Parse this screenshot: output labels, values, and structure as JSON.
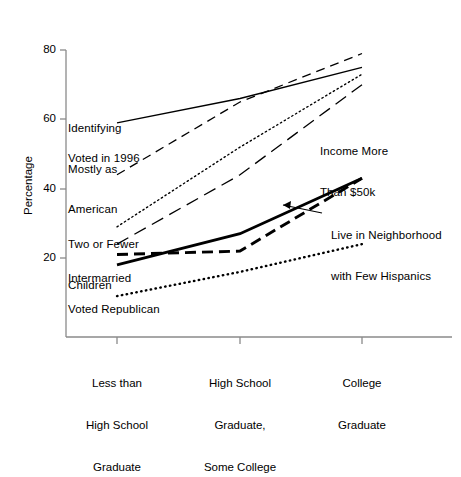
{
  "chart_data": {
    "type": "line",
    "title": "",
    "xlabel": "",
    "ylabel": "Percentage",
    "categories": [
      "Less than\nHigh School\nGraduate",
      "High School\nGraduate,\nSome College",
      "College\nGraduate"
    ],
    "category_labels": [
      [
        "Less than",
        "High School",
        "Graduate"
      ],
      [
        "High School",
        "Graduate,",
        "Some College"
      ],
      [
        "College",
        "Graduate"
      ]
    ],
    "ylim": [
      0,
      88
    ],
    "yticks": [
      20,
      40,
      60,
      80
    ],
    "ytick_labels": [
      "20",
      "40",
      "60",
      "80"
    ],
    "grid": false,
    "legend_position": "inline-annotations",
    "series": [
      {
        "name": "Identifying Mostly as American",
        "style": "solid-thin",
        "values": [
          59,
          66,
          75
        ]
      },
      {
        "name": "Voted in 1996",
        "style": "dashed",
        "values": [
          44,
          65,
          79
        ]
      },
      {
        "name": "Two or Fewer Children",
        "style": "dotted-fine",
        "values": [
          29,
          52,
          73
        ]
      },
      {
        "name": "Income More Than $50k",
        "style": "long-dash",
        "values": [
          24,
          44,
          70
        ]
      },
      {
        "name": "Live in Neighborhood with Few Hispanics",
        "style": "solid-thick",
        "values": [
          18,
          27,
          43
        ]
      },
      {
        "name": "Intermarried",
        "style": "dashed-thick",
        "values": [
          21,
          22,
          43
        ]
      },
      {
        "name": "Voted Republican",
        "style": "dotted-thick",
        "values": [
          9,
          16,
          24
        ]
      }
    ],
    "annotations": [
      {
        "id": "identifying-mostly-as-american",
        "lines": [
          "Identifying",
          "Mostly as",
          "American"
        ]
      },
      {
        "id": "voted-in-1996",
        "lines": [
          "Voted in 1996"
        ]
      },
      {
        "id": "two-or-fewer-children",
        "lines": [
          "Two or Fewer",
          "Children"
        ]
      },
      {
        "id": "intermarried",
        "lines": [
          "Intermarried"
        ]
      },
      {
        "id": "voted-republican",
        "lines": [
          "Voted Republican"
        ]
      },
      {
        "id": "income-more-than-50k",
        "lines": [
          "Income More",
          "Than $50k"
        ]
      },
      {
        "id": "live-in-neighborhood-few-hispanics",
        "lines": [
          "Live in Neighborhood",
          "with Few Hispanics"
        ]
      }
    ],
    "colors": {
      "line": "#000000",
      "axis": "#808080",
      "text": "#000000",
      "background": "#ffffff"
    }
  },
  "axis": {
    "y_label": "Percentage",
    "y_tick_0": "20",
    "y_tick_1": "40",
    "y_tick_2": "60",
    "y_tick_3": "80"
  },
  "annotations": {
    "a0_l0": "Identifying",
    "a0_l1": "Mostly as",
    "a0_l2": "American",
    "a1_l0": "Voted in 1996",
    "a2_l0": "Two or Fewer",
    "a2_l1": "Children",
    "a3_l0": "Intermarried",
    "a4_l0": "Voted Republican",
    "a5_l0": "Income More",
    "a5_l1": "Than $50k",
    "a6_l0": "Live in Neighborhood",
    "a6_l1": "with Few Hispanics"
  },
  "categories": {
    "c0_l0": "Less than",
    "c0_l1": "High School",
    "c0_l2": "Graduate",
    "c1_l0": "High School",
    "c1_l1": "Graduate,",
    "c1_l2": "Some College",
    "c2_l0": "College",
    "c2_l1": "Graduate"
  }
}
